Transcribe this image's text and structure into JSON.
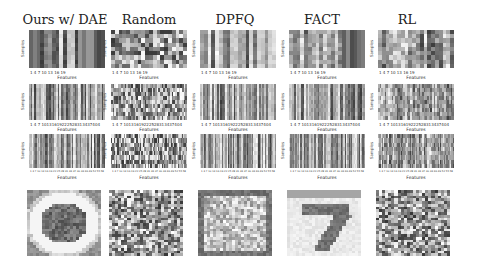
{
  "figure": {
    "columns": [
      "Ours w/ DAE",
      "Random",
      "DPFQ",
      "FACT",
      "RL"
    ],
    "axis": {
      "xlabel": "Features",
      "ylabel": "Samples",
      "row1_xticks": "1   4   7  10  13  16  19",
      "row2_xticks": "1  4  7 10131619222528313437404",
      "row3_xticks": "1 4 7 10 13 16 19 22 25 28 31 34 37 40 43 46 49 52 55 58",
      "row1_yticks": [
        "1",
        "3",
        "5",
        "7",
        "9"
      ]
    }
  },
  "chart_data": {
    "type": "heatmap",
    "title": "",
    "layout": "grid of 4 rows x 5 columns; columns are methods",
    "columns": [
      "Ours w/ DAE",
      "Random",
      "DPFQ",
      "FACT",
      "RL"
    ],
    "rows": [
      {
        "name": "feature-sample heatmap (~20 features)",
        "xlabel": "Features",
        "ylabel": "Samples",
        "xticks": [
          1,
          4,
          7,
          10,
          13,
          16,
          19
        ]
      },
      {
        "name": "feature-sample heatmap (~43 features)",
        "xlabel": "Features",
        "ylabel": "Samples",
        "xticks": [
          1,
          4,
          7,
          10,
          13,
          16,
          19,
          22,
          25,
          28,
          31,
          34,
          37,
          40,
          43
        ]
      },
      {
        "name": "feature-sample heatmap (many features)",
        "xlabel": "Features",
        "ylabel": "Samples"
      },
      {
        "name": "reconstructed image (MNIST digit)",
        "notes": "Ours w/ DAE: blurry blob; Random: noise; DPFQ: noisy; FACT: clear digit 7; RL: noise"
      }
    ],
    "colormap": "grayscale",
    "legend": null
  }
}
